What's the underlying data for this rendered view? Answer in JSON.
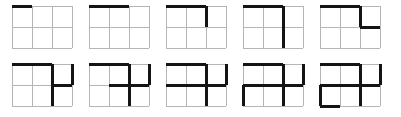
{
  "figure": {
    "columns": 3,
    "rows": 2,
    "cell_width": 20,
    "cell_height": 21,
    "thin_line_color": "#b5b5b5",
    "thick_line_color": "#141414",
    "background_color": "#ffffff",
    "thin_line_width": 1,
    "thick_line_width": 3,
    "panel_count": 10,
    "panels_per_row": 5
  },
  "panels": [
    {
      "index": 1,
      "name": "panel-1",
      "description": "thick top edge over column 1",
      "thick_horizontal": [
        {
          "x": 0,
          "y": 0,
          "span": 1
        }
      ],
      "thick_vertical": []
    },
    {
      "index": 2,
      "name": "panel-2",
      "description": "thick top edge over columns 1-2",
      "thick_horizontal": [
        {
          "x": 0,
          "y": 0,
          "span": 2
        }
      ],
      "thick_vertical": []
    },
    {
      "index": 3,
      "name": "panel-3",
      "description": "thick top edge columns 1-2 plus thick vertical down column boundary 2 through row 1",
      "thick_horizontal": [
        {
          "x": 0,
          "y": 0,
          "span": 2
        }
      ],
      "thick_vertical": [
        {
          "x": 2,
          "y": 0,
          "span": 1
        }
      ]
    },
    {
      "index": 4,
      "name": "panel-4",
      "description": "thick top edge columns 1-2 plus thick vertical down column boundary 2 through both rows",
      "thick_horizontal": [
        {
          "x": 0,
          "y": 0,
          "span": 2
        }
      ],
      "thick_vertical": [
        {
          "x": 2,
          "y": 0,
          "span": 2
        }
      ]
    },
    {
      "index": 5,
      "name": "panel-5",
      "description": "thick top edge columns 1-2, vertical boundary 2 row 1, then thick middle horizontal across column 3",
      "thick_horizontal": [
        {
          "x": 0,
          "y": 0,
          "span": 2
        },
        {
          "x": 2,
          "y": 1,
          "span": 1
        }
      ],
      "thick_vertical": [
        {
          "x": 2,
          "y": 0,
          "span": 1
        }
      ]
    },
    {
      "index": 6,
      "name": "panel-6",
      "description": "top edge columns 1-2, vertical boundary 2 both rows, middle horizontal column 3, right edge row 1",
      "thick_horizontal": [
        {
          "x": 0,
          "y": 0,
          "span": 2
        },
        {
          "x": 2,
          "y": 1,
          "span": 1
        }
      ],
      "thick_vertical": [
        {
          "x": 2,
          "y": 0,
          "span": 2
        },
        {
          "x": 3,
          "y": 0,
          "span": 1
        }
      ]
    },
    {
      "index": 7,
      "name": "panel-7",
      "description": "adds thick middle horizontal across column 2",
      "thick_horizontal": [
        {
          "x": 0,
          "y": 0,
          "span": 2
        },
        {
          "x": 1,
          "y": 1,
          "span": 1
        },
        {
          "x": 2,
          "y": 1,
          "span": 1
        }
      ],
      "thick_vertical": [
        {
          "x": 2,
          "y": 0,
          "span": 2
        },
        {
          "x": 3,
          "y": 0,
          "span": 1
        }
      ]
    },
    {
      "index": 8,
      "name": "panel-8",
      "description": "adds thick middle horizontal across column 1 so full middle row spans columns 1-3",
      "thick_horizontal": [
        {
          "x": 0,
          "y": 0,
          "span": 2
        },
        {
          "x": 0,
          "y": 1,
          "span": 3
        }
      ],
      "thick_vertical": [
        {
          "x": 2,
          "y": 0,
          "span": 2
        },
        {
          "x": 3,
          "y": 0,
          "span": 1
        }
      ]
    },
    {
      "index": 9,
      "name": "panel-9",
      "description": "adds thick left edge of bottom-left cell",
      "thick_horizontal": [
        {
          "x": 0,
          "y": 0,
          "span": 2
        },
        {
          "x": 0,
          "y": 1,
          "span": 3
        }
      ],
      "thick_vertical": [
        {
          "x": 2,
          "y": 0,
          "span": 2
        },
        {
          "x": 3,
          "y": 0,
          "span": 1
        },
        {
          "x": 0,
          "y": 1,
          "span": 1
        }
      ]
    },
    {
      "index": 10,
      "name": "panel-10",
      "description": "adds thick bottom edge of bottom-left cell",
      "thick_horizontal": [
        {
          "x": 0,
          "y": 0,
          "span": 2
        },
        {
          "x": 0,
          "y": 1,
          "span": 3
        },
        {
          "x": 0,
          "y": 2,
          "span": 1
        }
      ],
      "thick_vertical": [
        {
          "x": 2,
          "y": 0,
          "span": 2
        },
        {
          "x": 3,
          "y": 0,
          "span": 1
        },
        {
          "x": 0,
          "y": 1,
          "span": 1
        }
      ]
    }
  ]
}
